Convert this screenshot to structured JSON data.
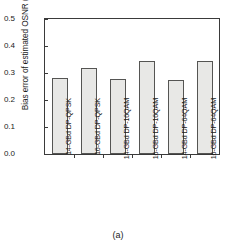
{
  "caption": "(a)",
  "chart_data": {
    "type": "bar",
    "title": "",
    "xlabel": "",
    "ylabel": "Bias error of estimated OSNR (dB)",
    "ylim": [
      0.0,
      0.5
    ],
    "yticks": [
      "0.0",
      "0.1",
      "0.2",
      "0.3",
      "0.4",
      "0.5"
    ],
    "ytick_values": [
      0.0,
      0.1,
      0.2,
      0.3,
      0.4,
      0.5
    ],
    "grid": false,
    "legend": null,
    "categories": [
      "14-GBd DP-QPSK",
      "16-GBd DP-QPSK",
      "14-GBd DP-16QAM",
      "16-GBd DP-16QAM",
      "14-GBd DP-64QAM",
      "16-GBd DP-64QAM"
    ],
    "values": [
      0.283,
      0.32,
      0.278,
      0.344,
      0.275,
      0.345
    ],
    "bar_fill_color": "#e8e8e6",
    "bar_edge_color": "#555553",
    "axis_color": "#3a3a3a"
  }
}
